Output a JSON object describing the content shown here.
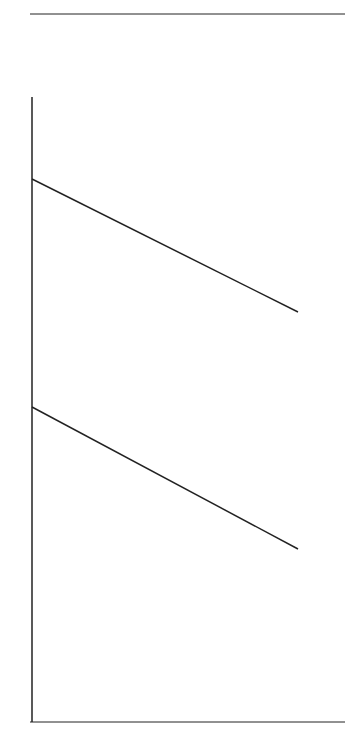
{
  "head": {
    "line1": "Quality",
    "line2": "Organization"
  },
  "categories": [
    {
      "letter": "B.",
      "name": "Product/Service"
    },
    {
      "letter": "D.",
      "name": "People"
    },
    {
      "letter": "F.",
      "name": "TQM Mindset"
    }
  ],
  "product_service": {
    "lower": [
      {
        "num": "12",
        "text": "Base products/services",
        "text2": "on customer"
      },
      {
        "num": "13",
        "text": "Customers \"sell\" other",
        "text2": "customers"
      },
      {
        "num": "14",
        "text": "Satisfy customer"
      },
      {
        "num": "15",
        "text": "Add value"
      }
    ],
    "upper": [
      {
        "num": "16",
        "text": "Customer input",
        "text2": "to product/service",
        "text3": "development"
      },
      {
        "num": "17",
        "text": "Partner actively",
        "text2": "with customers",
        "text3": "and suppliers"
      },
      {
        "num": "18",
        "text": "Measure customer",
        "text2": "satisfaction proactively"
      }
    ]
  },
  "people": {
    "lower": [
      {
        "num": "31",
        "text": "Feel \"I belong\""
      },
      {
        "num": "32",
        "text": "Recognize",
        "text2": "contribution"
      },
      {
        "num": "33",
        "text": "Train in job"
      },
      {
        "num": "34",
        "text": "Feel pride",
        "text2": "in work"
      },
      {
        "num": "35",
        "text": "Learn",
        "text2": "continuously"
      },
      {
        "num": "36",
        "text": "Committed",
        "text2": "to learn"
      }
    ],
    "upper": [
      {
        "num": "37",
        "text": "Share",
        "text2": "customer",
        "text3": "vision"
      },
      {
        "num": "38",
        "text": "\"Connected\"",
        "text2": "to customer"
      },
      {
        "num": "39",
        "text": "Trained in",
        "text2": "process",
        "text3": "improvement",
        "text4": "methods"
      },
      {
        "num": "40",
        "text": "Use people's",
        "text2": "ideas"
      },
      {
        "num": "41",
        "text": "Included in",
        "text2": "strategic planning"
      },
      {
        "num": "42",
        "text": "Work to",
        "text2": "potential"
      }
    ]
  },
  "tqm": {
    "lower": [
      {
        "num": "56",
        "text": "Practice win-win strategies"
      },
      {
        "num": "57",
        "text": "Improved quality",
        "text2": "increases productivity",
        "text3": "and profitability"
      },
      {
        "num": "58",
        "text": "Recognize that",
        "text2": "variation is",
        "text3": "normal"
      },
      {
        "num": "59",
        "text": "All employees",
        "text2": "learn",
        "text3": "continuously"
      },
      {
        "num": "60",
        "text": "Team work is",
        "text2": "encouraged"
      },
      {
        "num": "61",
        "text": "Add value to",
        "text2": "customer"
      },
      {
        "num": "62",
        "text": "All employees",
        "text2": "use data"
      },
      {
        "num": "63",
        "text": "Submit to",
        "text2": "PDCA cycle"
      },
      {
        "num": "64",
        "text": "Measure and",
        "text2": "track results"
      }
    ],
    "upper": [
      {
        "num": "65",
        "text": "Recognize that all",
        "text2": "customers result",
        "text3": "from a process"
      },
      {
        "num": "66",
        "text": "Recognize that quality",
        "text2": "means continuous",
        "text3": "improvement"
      },
      {
        "num": "67",
        "text": "Recognize that all",
        "text2": "workers want to do",
        "text3": "their best"
      },
      {
        "num": "68",
        "text": "Recognize that",
        "text2": "managers control",
        "text3": "work processes"
      },
      {
        "num": "69",
        "text": "Practice systems",
        "text2": "thinking"
      },
      {
        "num": "70",
        "text": "Move from enumerative",
        "text2": "to analytic approach"
      },
      {
        "num": "71",
        "text": "Customer needs define quality"
      }
    ]
  }
}
